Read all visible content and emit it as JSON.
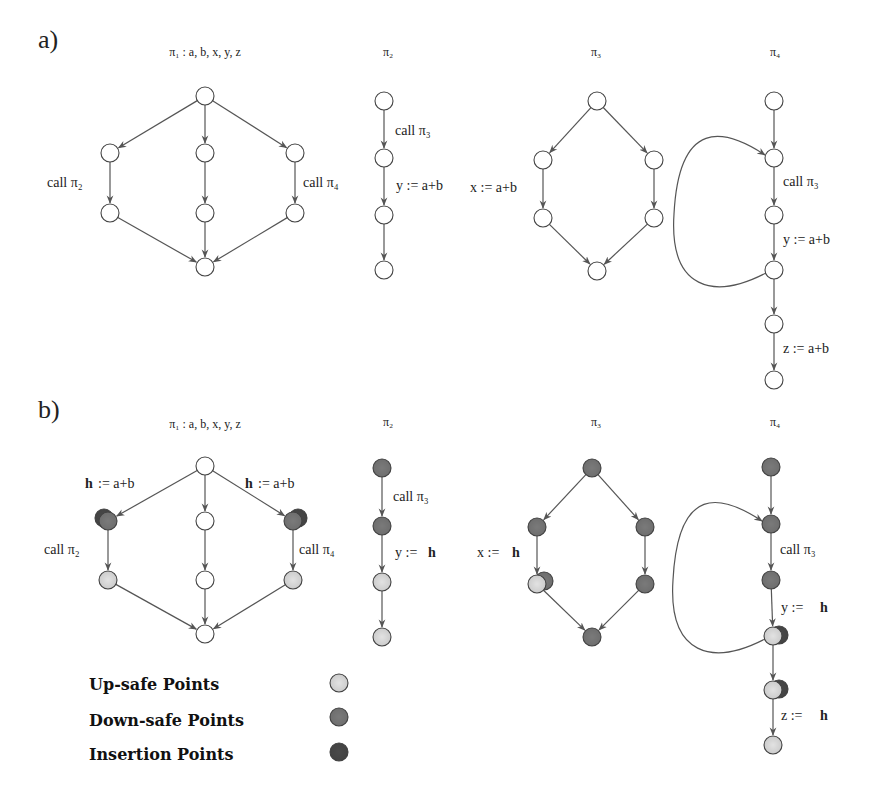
{
  "colors": {
    "plain": "#ffffff",
    "upsafe": "#e2e2e2",
    "downsafe": "#7a7a7a",
    "insertion": "#4a4a4a",
    "stroke": "#444444",
    "edge": "#555555"
  },
  "panels": [
    {
      "id": "a",
      "label": "a)",
      "label_pos": [
        38,
        48
      ],
      "procedures": [
        {
          "id": "pi1",
          "title": "π₁ : a, b, x, y, z",
          "title_pos": [
            205,
            56
          ],
          "nodes": [
            {
              "x": 205,
              "y": 96,
              "fill": "plain"
            },
            {
              "x": 110,
              "y": 153,
              "fill": "plain"
            },
            {
              "x": 205,
              "y": 153,
              "fill": "plain"
            },
            {
              "x": 295,
              "y": 153,
              "fill": "plain"
            },
            {
              "x": 110,
              "y": 213,
              "fill": "plain"
            },
            {
              "x": 205,
              "y": 213,
              "fill": "plain"
            },
            {
              "x": 295,
              "y": 213,
              "fill": "plain"
            },
            {
              "x": 205,
              "y": 267,
              "fill": "plain"
            }
          ],
          "edges": [
            [
              0,
              1
            ],
            [
              0,
              2
            ],
            [
              0,
              3
            ],
            [
              1,
              4
            ],
            [
              2,
              5
            ],
            [
              3,
              6
            ],
            [
              4,
              7
            ],
            [
              5,
              7
            ],
            [
              6,
              7
            ]
          ],
          "labels": [
            {
              "text": "call  π₂",
              "x": 47,
              "y": 187
            },
            {
              "text": "call  π₄",
              "x": 303,
              "y": 187
            }
          ]
        },
        {
          "id": "pi2",
          "title": "π₂",
          "title_pos": [
            388,
            56
          ],
          "nodes": [
            {
              "x": 384,
              "y": 101,
              "fill": "plain"
            },
            {
              "x": 384,
              "y": 158,
              "fill": "plain"
            },
            {
              "x": 384,
              "y": 215,
              "fill": "plain"
            },
            {
              "x": 384,
              "y": 270,
              "fill": "plain"
            }
          ],
          "edges": [
            [
              0,
              1
            ],
            [
              1,
              2
            ],
            [
              2,
              3
            ]
          ],
          "labels": [
            {
              "text": "call π₃",
              "x": 395,
              "y": 135
            },
            {
              "text": "y := a+b",
              "x": 396,
              "y": 190
            }
          ]
        },
        {
          "id": "pi3",
          "title": "π₃",
          "title_pos": [
            596,
            56
          ],
          "nodes": [
            {
              "x": 597,
              "y": 101,
              "fill": "plain"
            },
            {
              "x": 543,
              "y": 160,
              "fill": "plain"
            },
            {
              "x": 654,
              "y": 160,
              "fill": "plain"
            },
            {
              "x": 543,
              "y": 218,
              "fill": "plain"
            },
            {
              "x": 654,
              "y": 218,
              "fill": "plain"
            },
            {
              "x": 597,
              "y": 271,
              "fill": "plain"
            }
          ],
          "edges": [
            [
              0,
              1
            ],
            [
              0,
              2
            ],
            [
              1,
              3
            ],
            [
              2,
              4
            ],
            [
              3,
              5
            ],
            [
              4,
              5
            ]
          ],
          "labels": [
            {
              "text": "x := a+b",
              "x": 470,
              "y": 192
            }
          ]
        },
        {
          "id": "pi4",
          "title": "π₄",
          "title_pos": [
            775,
            56
          ],
          "nodes": [
            {
              "x": 774,
              "y": 101,
              "fill": "plain"
            },
            {
              "x": 774,
              "y": 158,
              "fill": "plain"
            },
            {
              "x": 774,
              "y": 215,
              "fill": "plain"
            },
            {
              "x": 774,
              "y": 270,
              "fill": "plain"
            },
            {
              "x": 774,
              "y": 324,
              "fill": "plain"
            },
            {
              "x": 774,
              "y": 380,
              "fill": "plain"
            }
          ],
          "edges": [
            [
              0,
              1
            ],
            [
              1,
              2
            ],
            [
              2,
              3
            ],
            [
              3,
              4
            ],
            [
              4,
              5
            ]
          ],
          "loop": {
            "from": 3,
            "to": 1
          },
          "labels": [
            {
              "text": "call π₃",
              "x": 783,
              "y": 186
            },
            {
              "text": "y := a+b",
              "x": 783,
              "y": 244
            },
            {
              "text": "z := a+b",
              "x": 783,
              "y": 353
            }
          ]
        }
      ]
    },
    {
      "id": "b",
      "label": "b)",
      "label_pos": [
        38,
        418
      ],
      "procedures": [
        {
          "id": "pi1",
          "title": "π₁ : a, b, x, y, z",
          "title_pos": [
            205,
            428
          ],
          "nodes": [
            {
              "x": 205,
              "y": 466,
              "fill": "plain"
            },
            {
              "x": 108,
              "y": 521,
              "fill": "downsafe",
              "overlay": "insertion",
              "overlay_dx": -4,
              "overlay_dy": -3,
              "overlay_under": true
            },
            {
              "x": 205,
              "y": 521,
              "fill": "plain"
            },
            {
              "x": 293,
              "y": 521,
              "fill": "downsafe",
              "overlay": "insertion",
              "overlay_dx": 5,
              "overlay_dy": -3,
              "overlay_under": true
            },
            {
              "x": 108,
              "y": 580,
              "fill": "upsafe"
            },
            {
              "x": 205,
              "y": 580,
              "fill": "plain"
            },
            {
              "x": 293,
              "y": 580,
              "fill": "upsafe"
            },
            {
              "x": 205,
              "y": 634,
              "fill": "plain"
            }
          ],
          "edges": [
            [
              0,
              1
            ],
            [
              0,
              2
            ],
            [
              0,
              3
            ],
            [
              1,
              4
            ],
            [
              2,
              5
            ],
            [
              3,
              6
            ],
            [
              4,
              7
            ],
            [
              5,
              7
            ],
            [
              6,
              7
            ]
          ],
          "labels": [
            {
              "text": "h",
              "x": 85,
              "y": 488,
              "bold": true
            },
            {
              "text": ":= a+b",
              "x": 98,
              "y": 488
            },
            {
              "text": "h",
              "x": 245,
              "y": 488,
              "bold": true
            },
            {
              "text": ":= a+b",
              "x": 258,
              "y": 488
            },
            {
              "text": "call  π₂",
              "x": 44,
              "y": 554
            },
            {
              "text": "call  π₄",
              "x": 299,
              "y": 554
            }
          ]
        },
        {
          "id": "pi2",
          "title": "π₂",
          "title_pos": [
            388,
            426
          ],
          "nodes": [
            {
              "x": 382,
              "y": 468,
              "fill": "downsafe"
            },
            {
              "x": 382,
              "y": 526,
              "fill": "downsafe"
            },
            {
              "x": 382,
              "y": 582,
              "fill": "upsafe"
            },
            {
              "x": 382,
              "y": 637,
              "fill": "upsafe"
            }
          ],
          "edges": [
            [
              0,
              1
            ],
            [
              1,
              2
            ],
            [
              2,
              3
            ]
          ],
          "labels": [
            {
              "text": "call π₃",
              "x": 393,
              "y": 501
            },
            {
              "text": "y :=",
              "x": 395,
              "y": 557
            },
            {
              "text": "h",
              "x": 428,
              "y": 557,
              "bold": true
            }
          ]
        },
        {
          "id": "pi3",
          "title": "π₃",
          "title_pos": [
            596,
            426
          ],
          "nodes": [
            {
              "x": 592,
              "y": 468,
              "fill": "downsafe"
            },
            {
              "x": 537,
              "y": 527,
              "fill": "downsafe"
            },
            {
              "x": 645,
              "y": 527,
              "fill": "downsafe"
            },
            {
              "x": 537,
              "y": 584,
              "fill": "upsafe",
              "overlay": "downsafe",
              "overlay_dx": 7,
              "overlay_dy": -3,
              "overlay_under": true
            },
            {
              "x": 645,
              "y": 584,
              "fill": "downsafe"
            },
            {
              "x": 592,
              "y": 637,
              "fill": "downsafe"
            }
          ],
          "edges": [
            [
              0,
              1
            ],
            [
              0,
              2
            ],
            [
              1,
              3
            ],
            [
              2,
              4
            ],
            [
              3,
              5
            ],
            [
              4,
              5
            ]
          ],
          "labels": [
            {
              "text": "x :=",
              "x": 477,
              "y": 557
            },
            {
              "text": "h",
              "x": 512,
              "y": 557,
              "bold": true
            }
          ]
        },
        {
          "id": "pi4",
          "title": "π₄",
          "title_pos": [
            775,
            426
          ],
          "nodes": [
            {
              "x": 771,
              "y": 467,
              "fill": "downsafe"
            },
            {
              "x": 771,
              "y": 524,
              "fill": "downsafe"
            },
            {
              "x": 771,
              "y": 580,
              "fill": "downsafe"
            },
            {
              "x": 773,
              "y": 636,
              "fill": "upsafe",
              "overlay": "insertion",
              "overlay_dx": 6,
              "overlay_dy": -1,
              "overlay_under": true
            },
            {
              "x": 773,
              "y": 690,
              "fill": "upsafe",
              "overlay": "insertion",
              "overlay_dx": 6,
              "overlay_dy": -1,
              "overlay_under": true
            },
            {
              "x": 773,
              "y": 745,
              "fill": "upsafe"
            }
          ],
          "edges": [
            [
              0,
              1
            ],
            [
              1,
              2
            ],
            [
              2,
              3
            ],
            [
              3,
              4
            ],
            [
              4,
              5
            ]
          ],
          "loop": {
            "from": 3,
            "to": 1
          },
          "labels": [
            {
              "text": "call π₃",
              "x": 780,
              "y": 554
            },
            {
              "text": "y :=",
              "x": 781,
              "y": 612
            },
            {
              "text": "h",
              "x": 820,
              "y": 612,
              "bold": true
            },
            {
              "text": "z :=",
              "x": 781,
              "y": 720
            },
            {
              "text": "h",
              "x": 820,
              "y": 720,
              "bold": true
            }
          ]
        }
      ]
    }
  ],
  "legend": {
    "items": [
      {
        "label": "Up-safe Points",
        "fill": "upsafe",
        "text_pos": [
          89,
          690
        ],
        "dot_pos": [
          339,
          683
        ]
      },
      {
        "label": "Down-safe Points",
        "fill": "downsafe",
        "text_pos": [
          89,
          726
        ],
        "dot_pos": [
          339,
          717
        ]
      },
      {
        "label": "Insertion Points",
        "fill": "insertion",
        "text_pos": [
          89,
          760
        ],
        "dot_pos": [
          339,
          752
        ]
      }
    ]
  },
  "node_radius": 9
}
